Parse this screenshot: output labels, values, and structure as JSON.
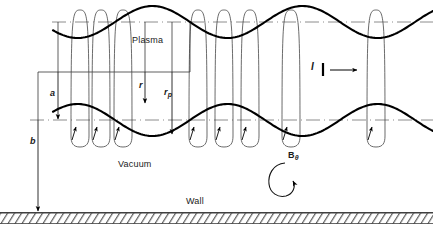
{
  "figure": {
    "type": "physics-schematic",
    "width": 433,
    "height": 232,
    "background": "#ffffff",
    "ink": "#000000",
    "axis_color": "#999999"
  },
  "regions": {
    "plasma_label": "Plasma",
    "vacuum_label": "Vacuum",
    "wall_label": "Wall"
  },
  "annotations": {
    "current_label": "I",
    "b_theta_label": "B",
    "b_theta_sub": "θ",
    "radius_label": "r",
    "plasma_radius_label": "r",
    "plasma_radius_sub": "p",
    "minor_radius_label": "a",
    "wall_radius_label": "b"
  },
  "geometry": {
    "axis_upper_y": 22,
    "axis_mid_y": 120,
    "wall_y": 213,
    "plasma_amplitude": 16,
    "plasma_wavelength": 150,
    "plasma_phase": 40,
    "field_loop_x": [
      80,
      101,
      123,
      198,
      224,
      250,
      291,
      376
    ],
    "field_loop_half_width": 9,
    "dim_line_y": 72,
    "dim_a_x": 58,
    "dim_b_x": 38
  },
  "chart_data": {
    "type": "line",
    "title": "",
    "xlabel": "",
    "ylabel": "",
    "series": [
      {
        "name": "plasma-upper-boundary",
        "comment": "sinusoid about upper dash-dot axis",
        "baseline_y": 22,
        "amplitude": 16,
        "wavelength": 150
      },
      {
        "name": "plasma-lower-boundary",
        "comment": "sinusoid about mid dash-dot axis, inverted phase",
        "baseline_y": 120,
        "amplitude": 16,
        "wavelength": 150
      }
    ]
  }
}
